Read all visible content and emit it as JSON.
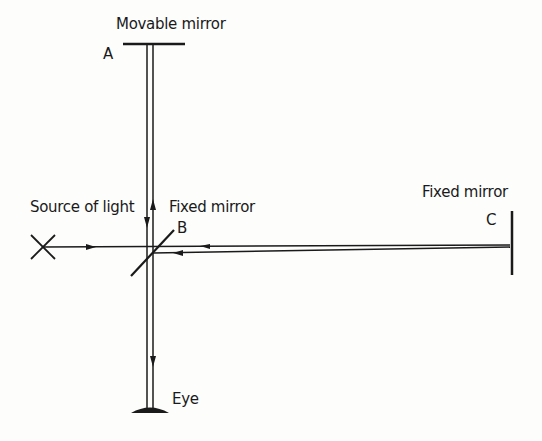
{
  "diagram": {
    "labels": {
      "movable_mirror": "Movable mirror",
      "point_a": "A",
      "source": "Source of light",
      "fixed_mirror_b": "Fixed mirror",
      "point_b": "B",
      "fixed_mirror_c": "Fixed mirror",
      "point_c": "C",
      "eye": "Eye"
    },
    "colors": {
      "ink": "#1a1a1a",
      "background": "#fdfdfc"
    }
  }
}
